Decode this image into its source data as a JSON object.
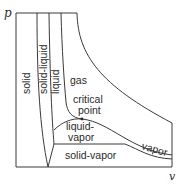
{
  "diagram": {
    "type": "p-v phase diagram",
    "axes": {
      "y_label": "p",
      "x_label": "v"
    },
    "regions": {
      "solid": "solid",
      "solid_liquid": "solid-liquid",
      "liquid": "liquid",
      "gas": "gas",
      "critical_point_line1": "critical",
      "critical_point_line2": "point",
      "liquid_vapor_line1": "liquid-",
      "liquid_vapor_line2": "vapor",
      "vapor": "vapor",
      "solid_vapor": "solid-vapor"
    },
    "colors": {
      "line": "#3a3a3a",
      "text": "#2a2a2a",
      "background": "#ffffff"
    }
  }
}
